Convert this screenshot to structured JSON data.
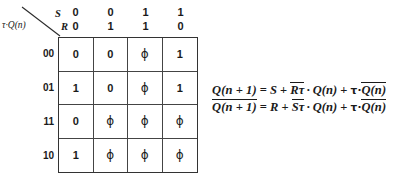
{
  "figure": {
    "kmap": {
      "corner": {
        "col_var": "S",
        "row_var_second": "R",
        "row_axis_label": "τ·Q(n)"
      },
      "column_headers": {
        "s_bits": [
          "0",
          "0",
          "1",
          "1"
        ],
        "r_bits": [
          "0",
          "1",
          "1",
          "0"
        ]
      },
      "row_labels": [
        "00",
        "01",
        "11",
        "10"
      ],
      "cells": [
        [
          "0",
          "0",
          "ϕ",
          "1"
        ],
        [
          "1",
          "0",
          "ϕ",
          "1"
        ],
        [
          "0",
          "ϕ",
          "ϕ",
          "ϕ"
        ],
        [
          "1",
          "ϕ",
          "ϕ",
          "ϕ"
        ]
      ]
    },
    "equations": [
      {
        "id": "q-next",
        "lhs_base": "Q(n + 1)",
        "lhs_overbar": false,
        "eq_sign": "=",
        "terms": [
          {
            "text": "S",
            "overbar": false
          },
          {
            "text": "Rτ",
            "overbar": true,
            "dot": true,
            "dot_operand": "Q(n)"
          },
          {
            "text": "τ·Q(n)",
            "overbar": "partial",
            "prefix": "τ·",
            "barred": "Q(n)"
          }
        ],
        "plain": "Q(n + 1) = S + R̄τ · Q(n) + τ·Q̄(n)"
      },
      {
        "id": "q-next-bar",
        "lhs_base": "Q(n + 1)",
        "lhs_overbar": true,
        "eq_sign": "=",
        "terms": [
          {
            "text": "R",
            "overbar": false
          },
          {
            "text": "Sτ",
            "overbar": true,
            "dot": true,
            "dot_operand": "Q(n)"
          },
          {
            "text": "τ·Q(n)",
            "overbar": "partial",
            "prefix": "τ·",
            "barred": "Q(n)"
          }
        ],
        "plain": "Q̄(n + 1) = R + S̄τ · Q(n) + τ·Q̄(n)"
      }
    ],
    "tokens": {
      "plus": "+",
      "equals": "=",
      "dot": "·",
      "tau": "τ",
      "lhs_q": "Q(n + 1)",
      "q_of_n": "Q(n)",
      "term_s": "S",
      "term_r": "R",
      "term_rtau": "Rτ",
      "term_stau": "Sτ",
      "tau_dot": "τ·"
    },
    "colors": {
      "background": "#ffffff",
      "ink": "#1a1a1a",
      "grid_line": "#444444"
    }
  }
}
